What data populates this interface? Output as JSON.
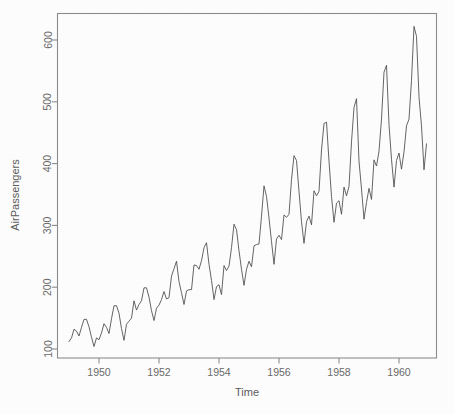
{
  "figure": {
    "background_color": "#fefefe",
    "line_color": "#4a4a4a",
    "axis_color": "#8d8d8d",
    "text_color": "#5a5a5a"
  },
  "chart_data": {
    "type": "line",
    "title": "",
    "subtitle": "",
    "xlabel": "Time",
    "ylabel": "AirPassengers",
    "xlim": [
      1949.0,
      1961.0
    ],
    "ylim": [
      88,
      640
    ],
    "grid": false,
    "legend": null,
    "legend_position": "none",
    "xticks": [
      1950,
      1952,
      1954,
      1956,
      1958,
      1960
    ],
    "xticklabels": [
      "1950",
      "1952",
      "1954",
      "1956",
      "1958",
      "1960"
    ],
    "yticks": [
      100,
      200,
      300,
      400,
      500,
      600
    ],
    "yticklabels": [
      "100",
      "200",
      "300",
      "400",
      "500",
      "600"
    ],
    "series": [
      {
        "name": "AirPassengers",
        "x_start": 1949.0,
        "x_step": 0.0833333,
        "values": [
          112,
          118,
          132,
          129,
          121,
          135,
          148,
          148,
          136,
          119,
          104,
          118,
          115,
          126,
          141,
          135,
          125,
          149,
          170,
          170,
          158,
          133,
          114,
          140,
          145,
          150,
          178,
          163,
          172,
          178,
          199,
          199,
          184,
          162,
          146,
          166,
          171,
          180,
          193,
          181,
          183,
          218,
          230,
          242,
          209,
          191,
          172,
          194,
          196,
          196,
          236,
          235,
          229,
          243,
          264,
          272,
          237,
          211,
          180,
          201,
          204,
          188,
          235,
          227,
          234,
          264,
          302,
          293,
          259,
          229,
          203,
          229,
          242,
          233,
          267,
          269,
          270,
          315,
          364,
          347,
          312,
          274,
          237,
          278,
          284,
          277,
          317,
          313,
          318,
          374,
          413,
          405,
          355,
          306,
          271,
          306,
          315,
          301,
          356,
          348,
          355,
          422,
          465,
          467,
          404,
          347,
          305,
          336,
          340,
          318,
          362,
          348,
          363,
          435,
          491,
          505,
          404,
          359,
          310,
          337,
          360,
          342,
          406,
          396,
          420,
          472,
          548,
          559,
          463,
          407,
          362,
          405,
          417,
          391,
          419,
          461,
          472,
          535,
          622,
          606,
          508,
          461,
          390,
          432
        ]
      }
    ]
  }
}
